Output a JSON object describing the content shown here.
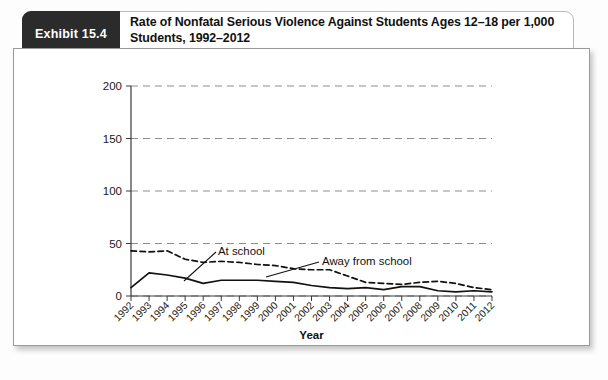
{
  "exhibit": {
    "tab_label": "Exhibit 15.4",
    "title": "Rate of Nonfatal Serious Violence Against Students Ages 12–18 per 1,000 Students, 1992–2012"
  },
  "chart_data": {
    "type": "line",
    "title": "",
    "xlabel": "Year",
    "ylabel": "",
    "categories": [
      "1992",
      "1993",
      "1994",
      "1995",
      "1996",
      "1997",
      "1998",
      "1999",
      "2000",
      "2001",
      "2002",
      "2003",
      "2004",
      "2005",
      "2006",
      "2007",
      "2008",
      "2009",
      "2010",
      "2011",
      "2012"
    ],
    "yticks": [
      0,
      50,
      100,
      150,
      200
    ],
    "ylim": [
      0,
      200
    ],
    "grid": "horizontal-dashed",
    "legend_position": "inline-annotation",
    "series": [
      {
        "name": "At school",
        "style": "solid",
        "color": "#111111",
        "values": [
          8,
          22,
          20,
          17,
          12,
          15,
          15,
          15,
          14,
          13,
          10,
          8,
          7,
          8,
          6,
          9,
          9,
          5,
          4,
          5,
          4
        ]
      },
      {
        "name": "Away from school",
        "style": "dashed",
        "color": "#111111",
        "values": [
          43,
          42,
          43,
          35,
          32,
          33,
          32,
          30,
          29,
          26,
          25,
          25,
          19,
          13,
          12,
          11,
          13,
          14,
          12,
          8,
          6
        ]
      }
    ],
    "annotations": [
      {
        "text": "At school",
        "points_to_series": "At school"
      },
      {
        "text": "Away from school",
        "points_to_series": "Away from school"
      }
    ]
  }
}
